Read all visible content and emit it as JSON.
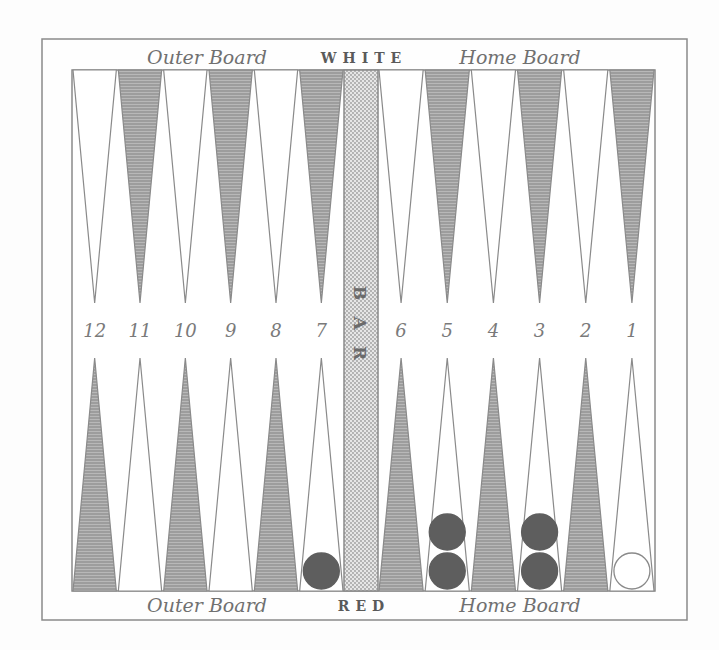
{
  "board": {
    "top_labels": {
      "outer": "Outer Board",
      "side": "WHITE",
      "home": "Home Board"
    },
    "bottom_labels": {
      "outer": "Outer Board",
      "side": "RED",
      "home": "Home Board"
    },
    "bar_label": [
      "B",
      "A",
      "R"
    ],
    "point_numbers": [
      "12",
      "11",
      "10",
      "9",
      "8",
      "7",
      "6",
      "5",
      "4",
      "3",
      "2",
      "1"
    ],
    "colors": {
      "frame": "#8a8a8a",
      "dark_point": "#9a9a9a",
      "light_point": "#ffffff",
      "bar": "#d4d4d4",
      "dark_checker": "#5e5e5e",
      "light_checker": "#ffffff"
    },
    "checkers": [
      {
        "point": "7",
        "side": "bottom",
        "count": 1,
        "color": "dark"
      },
      {
        "point": "5",
        "side": "bottom",
        "count": 2,
        "color": "dark"
      },
      {
        "point": "3",
        "side": "bottom",
        "count": 2,
        "color": "dark"
      },
      {
        "point": "1",
        "side": "bottom",
        "count": 1,
        "color": "light"
      }
    ]
  }
}
